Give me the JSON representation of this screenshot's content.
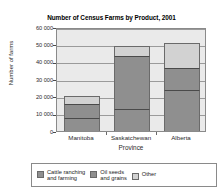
{
  "chart_data": {
    "type": "bar",
    "subtype": "stacked-vertical",
    "title": "Number of Census Farms by Product, 2001",
    "xlabel": "Province",
    "ylabel": "Number of farms",
    "categories": [
      "Manitoba",
      "Saskatchewan",
      "Alberta"
    ],
    "series": [
      {
        "name": "Cattle ranching and farming",
        "color": "#8f8f8f",
        "values": [
          7500,
          12500,
          23500
        ]
      },
      {
        "name": "Oil seeds and grains",
        "color": "#8f8f8f",
        "values": [
          8000,
          31000,
          13000
        ]
      },
      {
        "name": "Other",
        "color": "#d2d2d2",
        "values": [
          4500,
          5500,
          14000
        ]
      }
    ],
    "totals": [
      20000,
      49000,
      50500
    ],
    "ylim": [
      0,
      60000
    ],
    "yticks": [
      0,
      10000,
      20000,
      30000,
      40000,
      50000,
      60000
    ],
    "ytick_labels": [
      "0",
      "10 000",
      "20 000",
      "30 000",
      "40 000",
      "50 000",
      "60 000"
    ],
    "grid": true,
    "legend_position": "bottom",
    "plot_background": "#eaeaea"
  },
  "legend": {
    "entries": [
      {
        "label": "Cattle ranching\nand farming",
        "color": "#8f8f8f"
      },
      {
        "label": "Oil seeds\nand grains",
        "color": "#8f8f8f"
      },
      {
        "label": "Other",
        "color": "#d2d2d2"
      }
    ]
  }
}
